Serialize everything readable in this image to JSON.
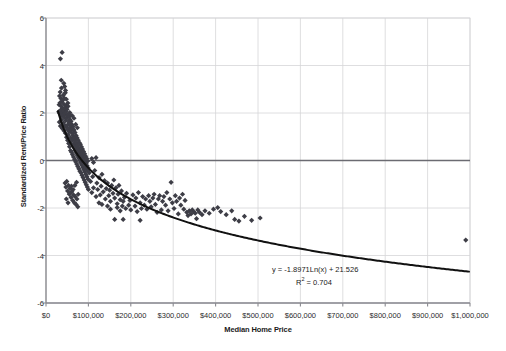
{
  "chart_data": {
    "type": "scatter",
    "title": "",
    "xlabel": "Median Home Price",
    "ylabel": "Standardized Rent/Price Ratio",
    "xlim": [
      0,
      1000000
    ],
    "ylim": [
      -6,
      6
    ],
    "grid": true,
    "legend": null,
    "xticks": [
      "$0",
      "$100,000",
      "$200,000",
      "$300,000",
      "$400,000",
      "$500,000",
      "$600,000",
      "$700,000",
      "$800,000",
      "$900,000",
      "$1,000,000"
    ],
    "xtick_values": [
      0,
      100000,
      200000,
      300000,
      400000,
      500000,
      600000,
      700000,
      800000,
      900000,
      1000000
    ],
    "yticks": [
      "6",
      "4",
      "2",
      "0",
      "-2",
      "-4",
      "-6"
    ],
    "ytick_values": [
      6,
      4,
      2,
      0,
      -2,
      -4,
      -6
    ],
    "marker": "diamond",
    "marker_color": "#3d3d46",
    "marker_size": 2.6,
    "trendline": {
      "type": "logarithmic",
      "equation_text": "y = -1.8971Ln(x) + 21.526",
      "r2_label": "R",
      "r2_exponent": "2",
      "r2_text": " = 0.704",
      "slope": -1.8971,
      "intercept": 21.526,
      "r2": 0.704,
      "color": "#111111",
      "width": 2.0
    },
    "zero_line": {
      "value": 0,
      "color": "#6b6b72",
      "width": 1.6
    },
    "points": [
      [
        30000,
        2.05
      ],
      [
        31000,
        2.35
      ],
      [
        31500,
        1.62
      ],
      [
        32000,
        2.72
      ],
      [
        32500,
        1.98
      ],
      [
        33000,
        2.43
      ],
      [
        33500,
        2.88
      ],
      [
        34000,
        1.45
      ],
      [
        34500,
        2.12
      ],
      [
        35000,
        2.62
      ],
      [
        35500,
        1.88
      ],
      [
        36000,
        2.28
      ],
      [
        36500,
        3.05
      ],
      [
        37000,
        1.72
      ],
      [
        37500,
        2.48
      ],
      [
        38000,
        2.02
      ],
      [
        38500,
        1.35
      ],
      [
        39000,
        2.55
      ],
      [
        39500,
        1.92
      ],
      [
        40000,
        2.18
      ],
      [
        40500,
        2.75
      ],
      [
        41000,
        1.58
      ],
      [
        41500,
        2.08
      ],
      [
        42000,
        2.38
      ],
      [
        42500,
        1.25
      ],
      [
        43000,
        1.82
      ],
      [
        43500,
        2.62
      ],
      [
        44000,
        1.48
      ],
      [
        44500,
        2.22
      ],
      [
        45000,
        1.95
      ],
      [
        45500,
        2.85
      ],
      [
        46000,
        1.15
      ],
      [
        46500,
        1.68
      ],
      [
        47000,
        2.05
      ],
      [
        47500,
        1.42
      ],
      [
        48000,
        2.32
      ],
      [
        48500,
        0.98
      ],
      [
        49000,
        1.78
      ],
      [
        49500,
        2.15
      ],
      [
        50000,
        1.32
      ],
      [
        50500,
        1.88
      ],
      [
        51000,
        0.85
      ],
      [
        51500,
        2.42
      ],
      [
        52000,
        1.52
      ],
      [
        52500,
        1.08
      ],
      [
        53000,
        1.95
      ],
      [
        53500,
        0.72
      ],
      [
        54000,
        1.62
      ],
      [
        54500,
        1.22
      ],
      [
        55000,
        1.85
      ],
      [
        55500,
        0.58
      ],
      [
        56000,
        1.38
      ],
      [
        56500,
        1.72
      ],
      [
        57000,
        0.95
      ],
      [
        57500,
        1.48
      ],
      [
        58000,
        0.42
      ],
      [
        58500,
        1.28
      ],
      [
        59000,
        1.65
      ],
      [
        59500,
        0.82
      ],
      [
        60000,
        1.18
      ],
      [
        60500,
        0.35
      ],
      [
        61000,
        1.52
      ],
      [
        61500,
        0.92
      ],
      [
        62000,
        1.35
      ],
      [
        62500,
        0.25
      ],
      [
        63000,
        1.05
      ],
      [
        63500,
        1.42
      ],
      [
        64000,
        0.68
      ],
      [
        64500,
        1.15
      ],
      [
        65000,
        0.15
      ],
      [
        65500,
        0.88
      ],
      [
        66000,
        1.28
      ],
      [
        66500,
        0.55
      ],
      [
        67000,
        0.98
      ],
      [
        67500,
        0.05
      ],
      [
        68000,
        0.75
      ],
      [
        68500,
        1.18
      ],
      [
        69000,
        0.42
      ],
      [
        69500,
        0.85
      ],
      [
        70000,
        -0.05
      ],
      [
        70500,
        0.62
      ],
      [
        71000,
        1.05
      ],
      [
        71500,
        0.32
      ],
      [
        72000,
        0.72
      ],
      [
        72500,
        -0.15
      ],
      [
        73000,
        0.52
      ],
      [
        73500,
        0.95
      ],
      [
        74000,
        0.22
      ],
      [
        74500,
        0.62
      ],
      [
        75000,
        -0.25
      ],
      [
        75500,
        0.45
      ],
      [
        76000,
        0.85
      ],
      [
        76500,
        0.12
      ],
      [
        77000,
        0.52
      ],
      [
        77500,
        -0.35
      ],
      [
        78000,
        0.35
      ],
      [
        78500,
        0.75
      ],
      [
        79000,
        0.02
      ],
      [
        79500,
        0.42
      ],
      [
        80000,
        -0.45
      ],
      [
        80500,
        0.28
      ],
      [
        81000,
        0.68
      ],
      [
        81500,
        -0.08
      ],
      [
        82000,
        0.35
      ],
      [
        82500,
        -0.52
      ],
      [
        83000,
        0.18
      ],
      [
        83500,
        0.58
      ],
      [
        84000,
        -0.18
      ],
      [
        84500,
        0.25
      ],
      [
        85000,
        -0.62
      ],
      [
        85500,
        0.08
      ],
      [
        86000,
        0.48
      ],
      [
        86500,
        -0.28
      ],
      [
        87000,
        0.18
      ],
      [
        87500,
        -0.72
      ],
      [
        88000,
        -0.02
      ],
      [
        88500,
        0.38
      ],
      [
        89000,
        -0.38
      ],
      [
        89500,
        0.08
      ],
      [
        90000,
        -0.82
      ],
      [
        90500,
        -0.12
      ],
      [
        91000,
        0.28
      ],
      [
        91500,
        -0.48
      ],
      [
        92000,
        -0.02
      ],
      [
        92500,
        -0.92
      ],
      [
        93000,
        -0.22
      ],
      [
        93500,
        0.18
      ],
      [
        94000,
        -0.58
      ],
      [
        94500,
        -0.12
      ],
      [
        95000,
        -1.02
      ],
      [
        95500,
        -0.32
      ],
      [
        96000,
        0.08
      ],
      [
        96500,
        -0.68
      ],
      [
        97000,
        -0.22
      ],
      [
        97500,
        -1.12
      ],
      [
        98000,
        -0.42
      ],
      [
        98500,
        -0.02
      ],
      [
        99000,
        -0.78
      ],
      [
        99500,
        -0.32
      ],
      [
        100000,
        -1.22
      ],
      [
        34000,
        4.28
      ],
      [
        38000,
        4.55
      ],
      [
        42000,
        3.25
      ],
      [
        44000,
        3.12
      ],
      [
        46000,
        2.95
      ],
      [
        36000,
        3.38
      ],
      [
        48000,
        2.58
      ],
      [
        52000,
        2.28
      ],
      [
        56000,
        2.02
      ],
      [
        58000,
        1.92
      ],
      [
        62000,
        1.88
      ],
      [
        66000,
        1.78
      ],
      [
        70000,
        1.52
      ],
      [
        74000,
        1.38
      ],
      [
        45000,
        -0.95
      ],
      [
        47000,
        -1.12
      ],
      [
        49000,
        -0.88
      ],
      [
        51000,
        -1.28
      ],
      [
        53000,
        -1.05
      ],
      [
        55000,
        -1.42
      ],
      [
        57000,
        -1.18
      ],
      [
        59000,
        -1.55
      ],
      [
        61000,
        -1.32
      ],
      [
        63000,
        -1.68
      ],
      [
        65000,
        -1.45
      ],
      [
        67000,
        -1.78
      ],
      [
        69000,
        -1.52
      ],
      [
        71000,
        -1.85
      ],
      [
        73000,
        -1.62
      ],
      [
        75000,
        -1.95
      ],
      [
        48000,
        -1.62
      ],
      [
        52000,
        -1.78
      ],
      [
        56000,
        -1.38
      ],
      [
        60000,
        -1.08
      ],
      [
        64000,
        -1.22
      ],
      [
        68000,
        -1.05
      ],
      [
        72000,
        -0.92
      ],
      [
        76000,
        -1.42
      ],
      [
        102000,
        -0.52
      ],
      [
        105000,
        -0.88
      ],
      [
        108000,
        -1.35
      ],
      [
        110000,
        -0.68
      ],
      [
        112000,
        -1.15
      ],
      [
        115000,
        -0.42
      ],
      [
        118000,
        -1.52
      ],
      [
        120000,
        -0.95
      ],
      [
        122000,
        -1.22
      ],
      [
        125000,
        -0.72
      ],
      [
        128000,
        -1.45
      ],
      [
        130000,
        -1.08
      ],
      [
        132000,
        -0.58
      ],
      [
        135000,
        -1.32
      ],
      [
        138000,
        -0.85
      ],
      [
        140000,
        -1.62
      ],
      [
        142000,
        -1.18
      ],
      [
        145000,
        -0.95
      ],
      [
        148000,
        -1.48
      ],
      [
        150000,
        -1.25
      ],
      [
        152000,
        -1.72
      ],
      [
        155000,
        -1.05
      ],
      [
        158000,
        -1.38
      ],
      [
        160000,
        -0.82
      ],
      [
        162000,
        -1.58
      ],
      [
        165000,
        -1.15
      ],
      [
        168000,
        -1.82
      ],
      [
        170000,
        -1.42
      ],
      [
        172000,
        -1.05
      ],
      [
        175000,
        -1.65
      ],
      [
        178000,
        -1.28
      ],
      [
        180000,
        -1.92
      ],
      [
        108000,
        0.08
      ],
      [
        112000,
        -0.08
      ],
      [
        118000,
        0.12
      ],
      [
        125000,
        -1.78
      ],
      [
        132000,
        -1.85
      ],
      [
        145000,
        -1.92
      ],
      [
        152000,
        -2.05
      ],
      [
        162000,
        -2.48
      ],
      [
        168000,
        -1.98
      ],
      [
        175000,
        -2.12
      ],
      [
        182000,
        -1.72
      ],
      [
        185000,
        -1.55
      ],
      [
        188000,
        -2.02
      ],
      [
        190000,
        -1.38
      ],
      [
        195000,
        -1.88
      ],
      [
        198000,
        -1.68
      ],
      [
        200000,
        -2.08
      ],
      [
        205000,
        -1.45
      ],
      [
        210000,
        -1.92
      ],
      [
        212000,
        -1.58
      ],
      [
        215000,
        -2.15
      ],
      [
        218000,
        -1.35
      ],
      [
        222000,
        -1.78
      ],
      [
        225000,
        -2.02
      ],
      [
        228000,
        -1.52
      ],
      [
        232000,
        -1.88
      ],
      [
        235000,
        -1.62
      ],
      [
        238000,
        -2.05
      ],
      [
        242000,
        -1.48
      ],
      [
        245000,
        -1.72
      ],
      [
        248000,
        -1.95
      ],
      [
        252000,
        -1.58
      ],
      [
        255000,
        -1.42
      ],
      [
        258000,
        -1.85
      ],
      [
        262000,
        -2.18
      ],
      [
        265000,
        -1.62
      ],
      [
        268000,
        -1.48
      ],
      [
        272000,
        -2.08
      ],
      [
        275000,
        -1.72
      ],
      [
        278000,
        -1.52
      ],
      [
        282000,
        -1.88
      ],
      [
        285000,
        -1.35
      ],
      [
        288000,
        -2.12
      ],
      [
        292000,
        -1.62
      ],
      [
        295000,
        -0.92
      ],
      [
        298000,
        -1.78
      ],
      [
        302000,
        -2.02
      ],
      [
        305000,
        -1.48
      ],
      [
        308000,
        -1.72
      ],
      [
        312000,
        -2.25
      ],
      [
        315000,
        -1.58
      ],
      [
        318000,
        -1.88
      ],
      [
        322000,
        -1.42
      ],
      [
        325000,
        -2.05
      ],
      [
        328000,
        -1.68
      ],
      [
        332000,
        -2.18
      ],
      [
        335000,
        -2.32
      ],
      [
        338000,
        -2.12
      ],
      [
        342000,
        -2.25
      ],
      [
        345000,
        -2.08
      ],
      [
        348000,
        -2.15
      ],
      [
        352000,
        -2.22
      ],
      [
        355000,
        -2.45
      ],
      [
        358000,
        -2.08
      ],
      [
        362000,
        -2.18
      ],
      [
        368000,
        -2.28
      ],
      [
        375000,
        -2.12
      ],
      [
        385000,
        -2.22
      ],
      [
        395000,
        -2.05
      ],
      [
        405000,
        -1.98
      ],
      [
        412000,
        -2.15
      ],
      [
        425000,
        -2.28
      ],
      [
        438000,
        -2.12
      ],
      [
        445000,
        -2.48
      ],
      [
        455000,
        -2.55
      ],
      [
        468000,
        -2.35
      ],
      [
        485000,
        -2.52
      ],
      [
        505000,
        -2.42
      ],
      [
        222000,
        -2.52
      ],
      [
        182000,
        -2.48
      ],
      [
        990000,
        -3.35
      ]
    ]
  },
  "axes": {
    "xaxis_label": "Median Home Price",
    "yaxis_label": "Standardized Rent/Price Ratio"
  },
  "annotations": {
    "equation": "y = -1.8971Ln(x) + 21.526",
    "r_squared_prefix": "R",
    "r_squared_sup": "2",
    "r_squared_value": " = 0.704"
  },
  "colors": {
    "marker": "#3d3d46",
    "trendline": "#111111",
    "zero_line": "#6b6b72",
    "grid": "#d5d5d8",
    "axis": "#8a8a90",
    "background": "#ffffff",
    "text": "#1a1a1a"
  }
}
